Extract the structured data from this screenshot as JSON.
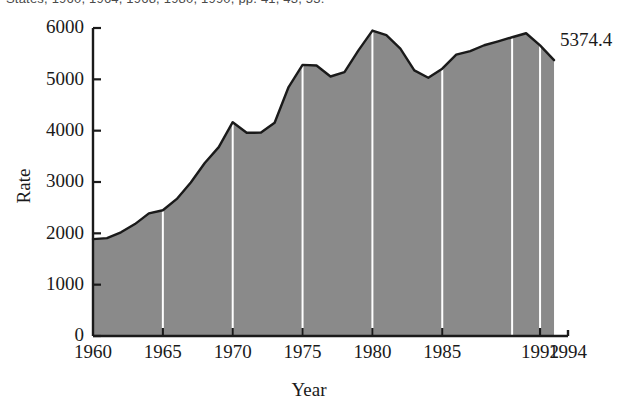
{
  "top_caption": "States, 1960, 1964, 1968, 1980, 1990, pp. 41, 43, 53.",
  "chart_data": {
    "type": "area",
    "title": "",
    "xlabel": "Year",
    "ylabel": "Rate",
    "xlim": [
      1960,
      1994
    ],
    "ylim": [
      0,
      6000
    ],
    "grid": true,
    "gridline_color": "#ffffff",
    "gridline_years": [
      1965,
      1970,
      1975,
      1980,
      1985,
      1990,
      1992
    ],
    "fill_color": "#8a8a8a",
    "line_color": "#1a1a1a",
    "legend": "none",
    "xticks": [
      1960,
      1965,
      1970,
      1975,
      1980,
      1985,
      1992,
      1994
    ],
    "xtick_labels": [
      "1960",
      "1965",
      "1970",
      "1975",
      "1980",
      "1985",
      "1992",
      "1994"
    ],
    "yticks": [
      0,
      1000,
      2000,
      3000,
      4000,
      5000,
      6000
    ],
    "ytick_labels": [
      "0",
      "1000",
      "2000",
      "3000",
      "4000",
      "5000",
      "6000"
    ],
    "annotations": [
      {
        "text": "5374.4",
        "x": 1993,
        "y": 5374.4
      }
    ],
    "x": [
      1960,
      1961,
      1962,
      1963,
      1964,
      1965,
      1966,
      1967,
      1968,
      1969,
      1970,
      1971,
      1972,
      1973,
      1974,
      1975,
      1976,
      1977,
      1978,
      1979,
      1980,
      1981,
      1982,
      1983,
      1984,
      1985,
      1986,
      1987,
      1988,
      1989,
      1990,
      1991,
      1992,
      1993
    ],
    "values": [
      1887,
      1906,
      2020,
      2180,
      2388,
      2449,
      2670,
      2990,
      3370,
      3680,
      4165,
      3960,
      3961,
      4155,
      4850,
      5282,
      5270,
      5055,
      5140,
      5565,
      5950,
      5860,
      5600,
      5175,
      5031,
      5207,
      5480,
      5550,
      5664,
      5741,
      5820,
      5898,
      5660,
      5374.4
    ]
  }
}
